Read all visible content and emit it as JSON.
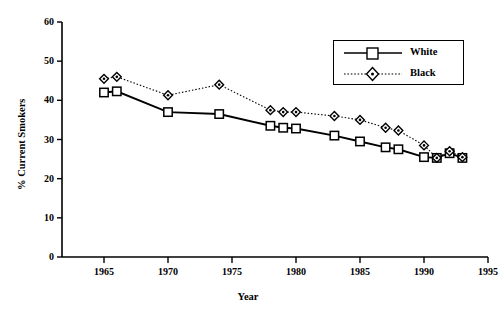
{
  "chart_data": {
    "type": "line",
    "title": "",
    "xlabel": "Year",
    "ylabel": "% Current Smokers",
    "xlim": [
      1963,
      1995
    ],
    "ylim": [
      0,
      60
    ],
    "xticks": [
      1965,
      1970,
      1975,
      1980,
      1985,
      1990,
      1995
    ],
    "yticks": [
      0,
      10,
      20,
      30,
      40,
      50,
      60
    ],
    "grid": false,
    "legend_position": "top-right",
    "legend": [
      "White",
      "Black"
    ],
    "series": [
      {
        "name": "White",
        "marker": "square-open",
        "line_style": "solid",
        "color": "#000000",
        "x": [
          1965,
          1966,
          1970,
          1974,
          1978,
          1979,
          1980,
          1983,
          1985,
          1987,
          1988,
          1990,
          1991,
          1992,
          1993
        ],
        "values": [
          42.0,
          42.3,
          37.0,
          36.5,
          33.5,
          33.0,
          32.8,
          31.0,
          29.5,
          28.0,
          27.5,
          25.5,
          25.3,
          26.5,
          25.3
        ]
      },
      {
        "name": "Black",
        "marker": "diamond-open",
        "line_style": "dotted",
        "color": "#000000",
        "x": [
          1965,
          1966,
          1970,
          1974,
          1978,
          1979,
          1980,
          1983,
          1985,
          1987,
          1988,
          1990,
          1991,
          1992,
          1993
        ],
        "values": [
          45.5,
          46.0,
          41.3,
          44.0,
          37.5,
          37.0,
          37.0,
          36.0,
          35.0,
          33.0,
          32.3,
          28.5,
          25.3,
          27.0,
          25.5
        ]
      }
    ]
  },
  "axes": {
    "y_tick_labels": [
      "60",
      "50",
      "40",
      "30",
      "20",
      "10",
      "0"
    ],
    "x_tick_labels": [
      "1965",
      "1970",
      "1975",
      "1980",
      "1985",
      "1990",
      "1995"
    ],
    "y_title": "% Current Smokers",
    "x_title": "Year"
  },
  "legend": {
    "items": [
      {
        "label": "White"
      },
      {
        "label": "Black"
      }
    ]
  }
}
